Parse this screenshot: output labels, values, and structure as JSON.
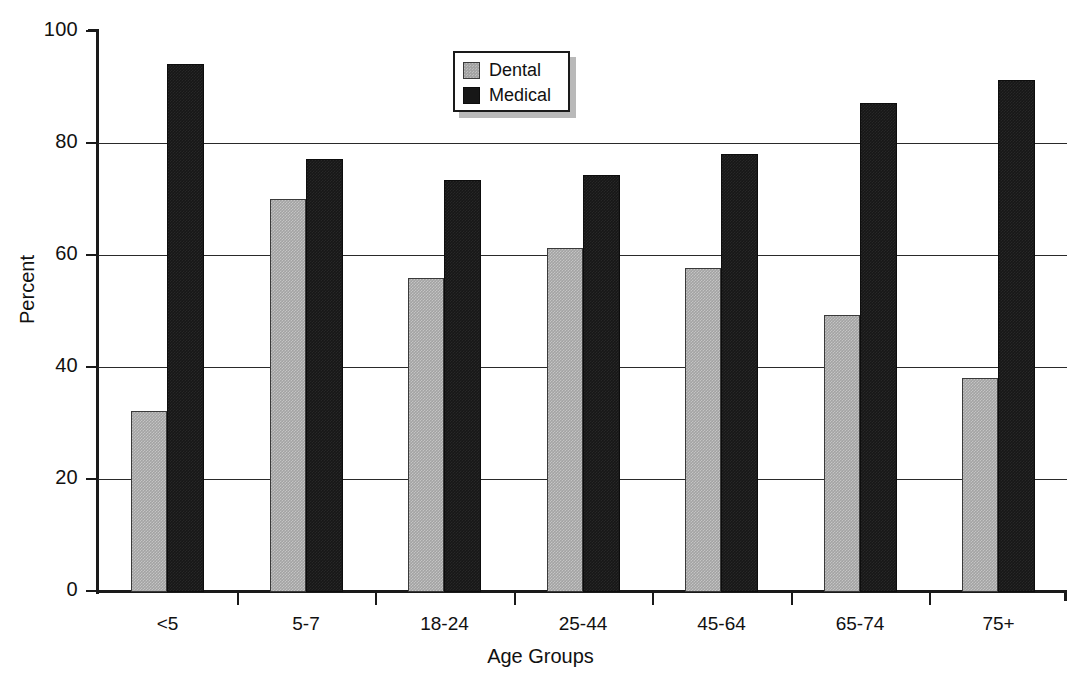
{
  "chart_data": {
    "type": "bar",
    "title": "",
    "xlabel": "Age Groups",
    "ylabel": "Percent",
    "ylim": [
      0,
      100
    ],
    "yticks": [
      0,
      20,
      40,
      60,
      80,
      100
    ],
    "grid": true,
    "legend_position": "top-center",
    "categories": [
      "<5",
      "5-7",
      "18-24",
      "25-44",
      "45-64",
      "65-74",
      "75+"
    ],
    "series": [
      {
        "name": "Dental",
        "color": "#a3a3a3",
        "values": [
          32.4,
          70.1,
          56.1,
          61.4,
          57.9,
          49.5,
          38.3
        ]
      },
      {
        "name": "Medical",
        "color": "#171717",
        "values": [
          94.2,
          77.3,
          73.6,
          74.4,
          78.3,
          87.4,
          91.5
        ]
      }
    ]
  },
  "axis": {
    "y_tick_labels": [
      "0",
      "20",
      "40",
      "60",
      "80",
      "100"
    ],
    "y_label": "Percent",
    "x_label": "Age Groups",
    "x_tick_labels": [
      "<5",
      "5-7",
      "18-24",
      "25-44",
      "45-64",
      "65-74",
      "75+"
    ]
  },
  "legend": {
    "items": [
      {
        "label": "Dental",
        "swatch": "gray-swatch-icon"
      },
      {
        "label": "Medical",
        "swatch": "black-swatch-icon"
      }
    ]
  }
}
